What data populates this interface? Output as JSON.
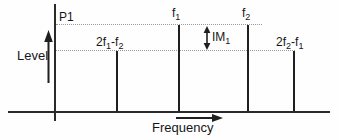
{
  "diagram": {
    "kind": "intermodulation-spectrum",
    "background": "#fefefe",
    "ink_color": "#1f1f1f",
    "dotted_color": "#9a9a9a",
    "y_axis_label": "Level",
    "x_axis_label": "Frequency",
    "p1_label": "P1",
    "im1_label": {
      "base": "IM",
      "sub": "1"
    },
    "spectral_lines": [
      {
        "name": "2f1-f2",
        "level": "intermod",
        "label": {
          "b1": "2f",
          "s1": "1",
          "b2": "-f",
          "s2": "2"
        }
      },
      {
        "name": "f1",
        "level": "fundamental",
        "label": {
          "b1": "f",
          "s1": "1"
        }
      },
      {
        "name": "f2",
        "level": "fundamental",
        "label": {
          "b1": "f",
          "s1": "2"
        }
      },
      {
        "name": "2f2-f1",
        "level": "intermod",
        "label": {
          "b1": "2f",
          "s1": "2",
          "b2": "-f",
          "s2": "1"
        }
      }
    ]
  }
}
